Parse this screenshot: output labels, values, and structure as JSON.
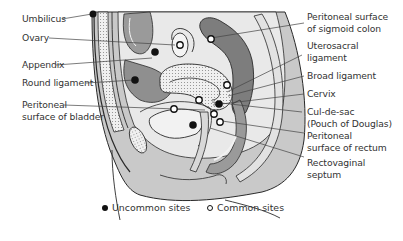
{
  "figure": {
    "left_labels": [
      {
        "id": "umbilicus",
        "lines": [
          "Umbilicus"
        ]
      },
      {
        "id": "ovary",
        "lines": [
          "Ovary"
        ]
      },
      {
        "id": "appendix",
        "lines": [
          "Appendix"
        ]
      },
      {
        "id": "round-ligament",
        "lines": [
          "Round ligament"
        ]
      },
      {
        "id": "peritoneal-surface-bladder",
        "lines": [
          "Peritoneal",
          "surface of bladder"
        ]
      }
    ],
    "right_labels": [
      {
        "id": "peritoneal-surface-sigmoid-colon",
        "lines": [
          "Peritoneal surface",
          "of sigmoid colon"
        ]
      },
      {
        "id": "uterosacral-ligament",
        "lines": [
          "Uterosacral",
          "ligament"
        ]
      },
      {
        "id": "broad-ligament",
        "lines": [
          "Broad ligament"
        ]
      },
      {
        "id": "cervix",
        "lines": [
          "Cervix"
        ]
      },
      {
        "id": "cul-de-sac",
        "lines": [
          "Cul-de-sac",
          "(Pouch of Douglas)"
        ]
      },
      {
        "id": "peritoneal-surface-rectum",
        "lines": [
          "Peritoneal",
          "surface of rectum"
        ]
      },
      {
        "id": "rectovaginal-septum",
        "lines": [
          "Rectovaginal",
          "septum"
        ]
      }
    ],
    "legend": [
      {
        "id": "uncommon",
        "marker": "filled-circle",
        "label": "Uncommon sites"
      },
      {
        "id": "common",
        "marker": "open-circle",
        "label": "Common sites"
      }
    ],
    "colors": {
      "body_fill": "#c9c9c9",
      "dark_organ": "#8a8a8a",
      "mid_organ": "#a6a6a6",
      "light_layer": "#e6e6e6",
      "outline": "#2a2a2a",
      "leader": "#444444"
    }
  }
}
